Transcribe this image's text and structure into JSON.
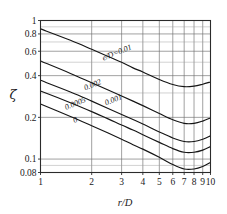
{
  "chart_data": {
    "type": "line",
    "title": "",
    "xlabel": "r/D",
    "ylabel": "ζ",
    "xscale": "log",
    "yscale": "log",
    "xlim": [
      1,
      10
    ],
    "ylim": [
      0.08,
      1
    ],
    "grid": true,
    "legend_position": "inline-labels",
    "xticks": [
      1,
      2,
      3,
      4,
      5,
      6,
      7,
      8,
      9,
      10
    ],
    "xtick_labels": [
      "1",
      "2",
      "3",
      "4",
      "5",
      "6",
      "7",
      "8",
      "9",
      "10"
    ],
    "yticks": [
      1,
      0.8,
      0.6,
      0.4,
      0.2,
      0.1,
      0.08
    ],
    "ytick_labels": [
      "1",
      "0.8",
      "0.6",
      "0.4",
      "0.2",
      "0.1",
      "0.08"
    ],
    "y_gridlines": [
      1,
      0.9,
      0.8,
      0.7,
      0.6,
      0.5,
      0.4,
      0.3,
      0.2,
      0.1,
      0.09,
      0.08
    ],
    "series": [
      {
        "name": "e/D=0.01",
        "label": "e/D=0.01",
        "x": [
          1,
          1.5,
          2,
          2.5,
          3,
          3.5,
          4,
          5,
          6,
          7,
          8,
          9,
          10
        ],
        "y": [
          0.87,
          0.72,
          0.62,
          0.55,
          0.5,
          0.455,
          0.425,
          0.375,
          0.345,
          0.333,
          0.336,
          0.347,
          0.36
        ]
      },
      {
        "name": "0.002",
        "label": "0.002",
        "x": [
          1,
          1.5,
          2,
          2.5,
          3,
          3.5,
          4,
          5,
          6,
          7,
          8,
          9,
          10
        ],
        "y": [
          0.51,
          0.415,
          0.355,
          0.315,
          0.285,
          0.262,
          0.243,
          0.213,
          0.192,
          0.181,
          0.181,
          0.188,
          0.198
        ]
      },
      {
        "name": "0.001",
        "label": "0.001",
        "x": [
          1,
          1.5,
          2,
          2.5,
          3,
          3.5,
          4,
          5,
          6,
          7,
          8,
          9,
          10
        ],
        "y": [
          0.37,
          0.305,
          0.262,
          0.232,
          0.21,
          0.193,
          0.179,
          0.157,
          0.142,
          0.134,
          0.134,
          0.139,
          0.147
        ]
      },
      {
        "name": "0.0005",
        "label": "0.0005",
        "x": [
          1,
          1.5,
          2,
          2.5,
          3,
          3.5,
          4,
          5,
          6,
          7,
          8,
          9,
          10
        ],
        "y": [
          0.31,
          0.255,
          0.22,
          0.195,
          0.176,
          0.162,
          0.15,
          0.132,
          0.119,
          0.112,
          0.112,
          0.116,
          0.123
        ]
      },
      {
        "name": "0",
        "label": "0",
        "x": [
          1,
          1.5,
          2,
          2.5,
          3,
          3.5,
          4,
          5,
          6,
          7,
          8,
          9,
          10
        ],
        "y": [
          0.25,
          0.203,
          0.174,
          0.154,
          0.139,
          0.127,
          0.118,
          0.103,
          0.0913,
          0.0848,
          0.0848,
          0.0884,
          0.0945
        ]
      }
    ],
    "annotations": [
      {
        "text": "e/D=0.01",
        "x": 2.85,
        "y": 0.565,
        "rotation": -22
      },
      {
        "text": "0.002",
        "x": 2.05,
        "y": 0.33,
        "rotation": -22
      },
      {
        "text": "0.001",
        "x": 2.72,
        "y": 0.258,
        "rotation": -22
      },
      {
        "text": "0.0005",
        "x": 1.62,
        "y": 0.242,
        "rotation": -22
      },
      {
        "text": "0",
        "x": 1.62,
        "y": 0.184,
        "rotation": -22
      }
    ]
  },
  "axes": {
    "x_label": "r/D",
    "y_label": "ζ",
    "x_tick_labels": [
      "1",
      "2",
      "3",
      "4",
      "5",
      "6",
      "7",
      "8",
      "9",
      "10"
    ],
    "y_tick_labels": [
      "1",
      "0.8",
      "0.6",
      "0.4",
      "0.2",
      "0.1",
      "0.08"
    ]
  },
  "colors": {
    "background": "#ffffff",
    "curve": "#151515",
    "frame": "#2b2b2b",
    "grid_major": "#6e6e6e",
    "grid_minor": "#9a9a9a",
    "text": "#1a1a1a"
  }
}
